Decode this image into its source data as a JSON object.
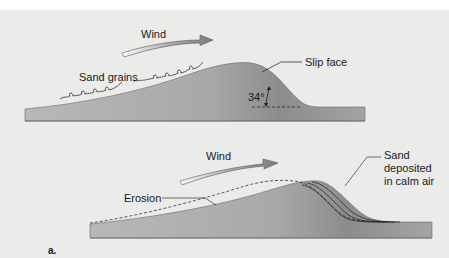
{
  "figure": {
    "panel_label": "a.",
    "top_diagram": {
      "wind_label": "Wind",
      "sand_grains_label": "Sand grains",
      "slip_face_label": "Slip face",
      "angle_label": "34°"
    },
    "bottom_diagram": {
      "wind_label": "Wind",
      "erosion_label": "Erosion",
      "deposit_label_line1": "Sand",
      "deposit_label_line2": "deposited",
      "deposit_label_line3": "in calm air"
    }
  },
  "colors": {
    "background": "#ebebea",
    "dune_dark": "#8a8a8a",
    "dune_light": "#c8c8c8",
    "arrow": "#8c8c8c",
    "text": "#1a1a1a"
  }
}
